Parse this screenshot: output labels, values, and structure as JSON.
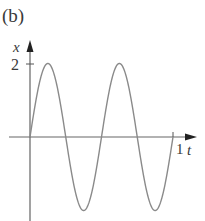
{
  "panel_label": "(b)",
  "chart_data": {
    "type": "line",
    "title": "",
    "panel": "(b)",
    "xlabel": "t",
    "ylabel": "x",
    "x_ticks": [
      {
        "value": 1,
        "label": "1"
      }
    ],
    "y_ticks": [
      {
        "value": 2,
        "label": "2"
      }
    ],
    "xlim": [
      0,
      1
    ],
    "ylim": [
      -2,
      2
    ],
    "grid": false,
    "legend": null,
    "series": [
      {
        "name": "x(t)",
        "function": "x = 2 sin(4πt)",
        "amplitude": 2,
        "cycles": 2,
        "period": 0.5,
        "x": [
          0,
          0.125,
          0.25,
          0.375,
          0.5,
          0.625,
          0.75,
          0.875,
          1.0
        ],
        "y": [
          0,
          2,
          0,
          -2,
          0,
          2,
          0,
          -2,
          0
        ]
      }
    ],
    "colors": {
      "curve": "#8a8a8a",
      "axes": "#555555",
      "text": "#3a3a3a"
    }
  },
  "axis_labels": {
    "x": "t",
    "y": "x"
  },
  "tick_labels": {
    "y_max": "2",
    "x_max": "1"
  }
}
